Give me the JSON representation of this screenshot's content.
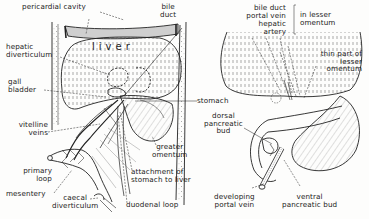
{
  "figure": {
    "left_panel": {
      "organ_text": "liver",
      "labels": {
        "pericardial_cavity": "pericardial cavity",
        "bile_duct": "bile\nduct",
        "hepatic_diverticulum": "hepatic\ndiverticulum",
        "gall_bladder": "gall\nbladder",
        "stomach": "stomach",
        "vitelline_veins": "vitelline\nveins",
        "greater_omentum": "greater\nomentum",
        "primary_loop": "primary\nloop",
        "attachment": "attachment of\nstomach to liver",
        "mesentery": "mesentery",
        "caecal_diverticulum": "caecal\ndiverticulum",
        "duodenal_loop": "duodenal loop"
      }
    },
    "right_panel": {
      "labels": {
        "bile_duct": "bile duct",
        "portal_vein": "portal vein",
        "hepatic_artery": "hepatic\nartery",
        "in_lesser_omentum": "in lesser\nomentum",
        "thin_part": "thin part of\nlesser\nomentum",
        "dorsal_pancreatic_bud": "dorsal\npancreatic\nbud",
        "developing_portal_vein": "developing\nportal vein",
        "ventral_pancreatic_bud": "ventral\npancreatic bud"
      }
    }
  }
}
